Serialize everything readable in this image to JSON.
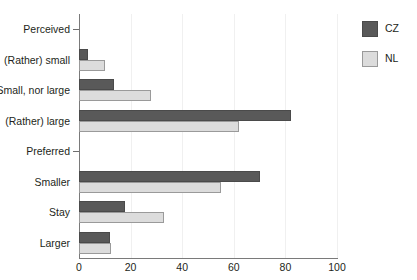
{
  "chart_data": {
    "type": "bar",
    "orientation": "horizontal",
    "title": "",
    "xlabel": "",
    "ylabel": "",
    "xlim": [
      0,
      100
    ],
    "xticks": [
      0,
      20,
      40,
      60,
      80,
      100
    ],
    "xtick_labels": [
      "0",
      "20",
      "40",
      "60",
      "80",
      "100"
    ],
    "grid": true,
    "grid_axis": "x",
    "legend_position": "top-right",
    "categories": [
      "Perceived",
      "(Rather) small",
      "Small, nor large",
      "(Rather) large",
      "Preferred",
      "Smaller",
      "Stay",
      "Larger"
    ],
    "group_headers": [
      "Perceived",
      "Preferred"
    ],
    "series": [
      {
        "name": "CZ",
        "color": "#595959",
        "values": [
          null,
          3.5,
          13.5,
          82,
          null,
          70,
          18,
          12
        ]
      },
      {
        "name": "NL",
        "color": "#dcdcdc",
        "values": [
          null,
          10,
          28,
          62,
          null,
          55,
          33,
          12.5
        ]
      }
    ]
  },
  "legend": {
    "items": [
      {
        "label": "CZ",
        "key": "cz"
      },
      {
        "label": "NL",
        "key": "nl"
      }
    ]
  }
}
